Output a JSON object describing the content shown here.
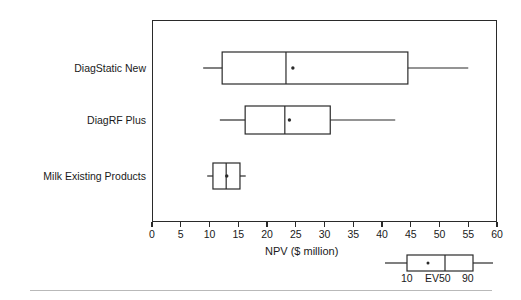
{
  "chart_data": {
    "type": "box",
    "title": "",
    "xlabel": "NPV ($ million)",
    "ylabel": "",
    "xlim": [
      0,
      60
    ],
    "xticks": [
      0,
      5,
      10,
      15,
      20,
      25,
      30,
      35,
      40,
      45,
      50,
      55,
      60
    ],
    "xtick_labels": [
      "0",
      "5",
      "10",
      "15",
      "20",
      "25",
      "30",
      "35",
      "40",
      "45",
      "50",
      "55",
      "60"
    ],
    "grid": false,
    "orientation": "horizontal",
    "legend_position": "below-axis-right",
    "categories": [
      "DiagStatic New",
      "DiagRF Plus",
      "Milk Existing Products"
    ],
    "boxes": [
      {
        "name": "DiagStatic New",
        "whisker_low": 8.9,
        "q10": 12.2,
        "median": 23.3,
        "mean": 24.5,
        "q90": 44.5,
        "whisker_high": 55.0
      },
      {
        "name": "DiagRF Plus",
        "whisker_low": 11.8,
        "q10": 16.2,
        "median": 23.1,
        "mean": 23.9,
        "q90": 31.0,
        "whisker_high": 42.3
      },
      {
        "name": "Milk Existing Products",
        "whisker_low": 9.6,
        "q10": 10.6,
        "median": 12.9,
        "mean": 13.0,
        "q90": 15.3,
        "whisker_high": 16.3
      }
    ]
  },
  "axis": {
    "title": "NPV ($ million)"
  },
  "legend": {
    "low_label": "10",
    "mid_label": "EV50",
    "high_label": "90"
  }
}
